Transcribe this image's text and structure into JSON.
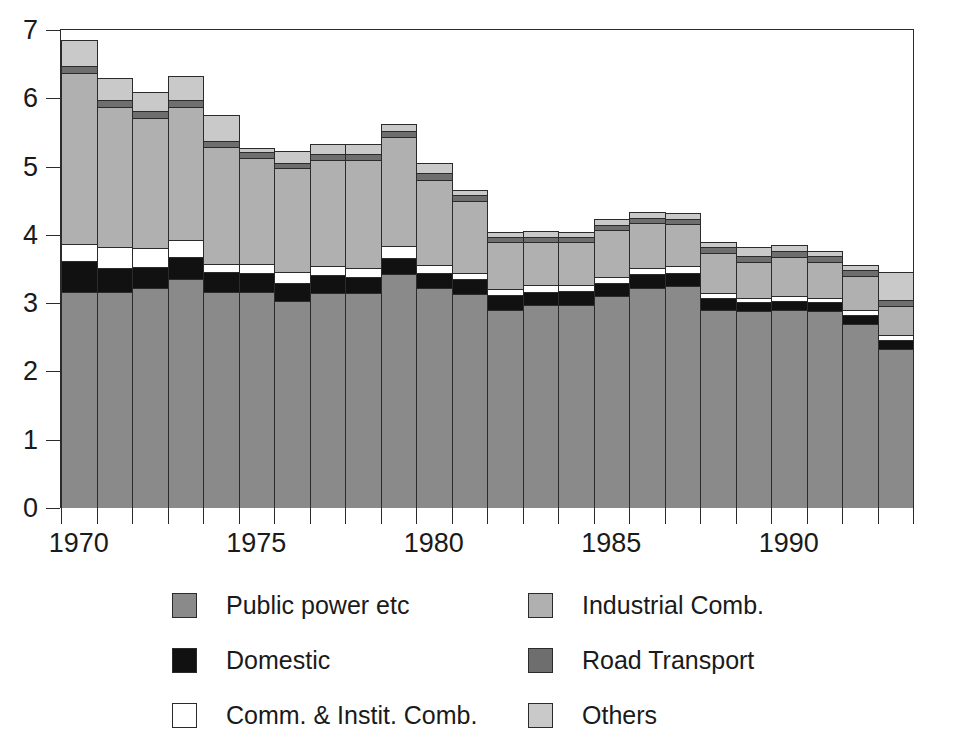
{
  "chart_data": {
    "type": "bar",
    "stacked": true,
    "title": "",
    "subtitle": "",
    "xlabel": "",
    "ylabel": "",
    "ylim": [
      0,
      7
    ],
    "ytick_labels": [
      "0",
      "1",
      "2",
      "3",
      "4",
      "5",
      "6",
      "7"
    ],
    "ytick_values": [
      0,
      1,
      2,
      3,
      4,
      5,
      6,
      7
    ],
    "grid": false,
    "legend_position": "bottom",
    "categories": [
      1970,
      1971,
      1972,
      1973,
      1974,
      1975,
      1976,
      1977,
      1978,
      1979,
      1980,
      1981,
      1982,
      1983,
      1984,
      1985,
      1986,
      1987,
      1988,
      1989,
      1990,
      1991,
      1992,
      1993
    ],
    "xtick_labels": [
      "1970",
      "1975",
      "1980",
      "1985",
      "1990"
    ],
    "xtick_values": [
      1970,
      1975,
      1980,
      1985,
      1990
    ],
    "series": [
      {
        "name": "Public power etc",
        "color": "#8a8a8a",
        "values": [
          3.17,
          3.17,
          3.22,
          3.35,
          3.17,
          3.17,
          3.03,
          3.15,
          3.15,
          3.43,
          3.22,
          3.13,
          2.9,
          2.97,
          2.97,
          3.1,
          3.22,
          3.25,
          2.9,
          2.88,
          2.9,
          2.88,
          2.7,
          2.33
        ]
      },
      {
        "name": "Domestic",
        "color": "#111111",
        "values": [
          0.45,
          0.35,
          0.31,
          0.33,
          0.28,
          0.27,
          0.27,
          0.26,
          0.24,
          0.23,
          0.22,
          0.22,
          0.22,
          0.2,
          0.21,
          0.2,
          0.2,
          0.19,
          0.17,
          0.13,
          0.13,
          0.13,
          0.13,
          0.13
        ]
      },
      {
        "name": "Comm. & Instit. Comb.",
        "color": "#ffffff",
        "values": [
          0.25,
          0.3,
          0.28,
          0.25,
          0.13,
          0.14,
          0.15,
          0.14,
          0.13,
          0.17,
          0.12,
          0.09,
          0.09,
          0.09,
          0.09,
          0.09,
          0.1,
          0.1,
          0.08,
          0.07,
          0.07,
          0.07,
          0.07,
          0.07
        ]
      },
      {
        "name": "Industrial Comb.",
        "color": "#b0b0b0",
        "values": [
          2.5,
          2.05,
          1.9,
          1.95,
          1.7,
          1.55,
          1.53,
          1.55,
          1.58,
          1.6,
          1.25,
          1.05,
          0.68,
          0.63,
          0.62,
          0.68,
          0.65,
          0.62,
          0.58,
          0.52,
          0.58,
          0.52,
          0.5,
          0.43
        ]
      },
      {
        "name": "Road Transport",
        "color": "#6e6e6e",
        "values": [
          0.1,
          0.1,
          0.1,
          0.1,
          0.1,
          0.08,
          0.08,
          0.08,
          0.08,
          0.09,
          0.09,
          0.09,
          0.08,
          0.08,
          0.08,
          0.08,
          0.08,
          0.08,
          0.09,
          0.09,
          0.09,
          0.09,
          0.09,
          0.08
        ]
      },
      {
        "name": "Others",
        "color": "#c9c9c9",
        "values": [
          0.38,
          0.33,
          0.28,
          0.35,
          0.37,
          0.07,
          0.17,
          0.15,
          0.15,
          0.1,
          0.15,
          0.08,
          0.08,
          0.08,
          0.08,
          0.08,
          0.08,
          0.08,
          0.07,
          0.14,
          0.08,
          0.08,
          0.07,
          0.42
        ]
      }
    ]
  },
  "legend": {
    "left_column": [
      {
        "label": "Public power etc",
        "color": "#8a8a8a",
        "swatch_name": "swatch-public-power"
      },
      {
        "label": "Domestic",
        "color": "#111111",
        "swatch_name": "swatch-domestic"
      },
      {
        "label": "Comm. & Instit. Comb.",
        "color": "#ffffff",
        "swatch_name": "swatch-comm-instit"
      }
    ],
    "right_column": [
      {
        "label": "Industrial Comb.",
        "color": "#b0b0b0",
        "swatch_name": "swatch-industrial"
      },
      {
        "label": "Road Transport",
        "color": "#6e6e6e",
        "swatch_name": "swatch-road-transport"
      },
      {
        "label": "Others",
        "color": "#c9c9c9",
        "swatch_name": "swatch-others"
      }
    ]
  },
  "colors": {
    "axis": "#2b2b2b",
    "background": "#ffffff",
    "public_power": "#8a8a8a",
    "domestic": "#111111",
    "comm_instit": "#ffffff",
    "industrial": "#b0b0b0",
    "road_transport": "#6e6e6e",
    "others": "#c9c9c9"
  }
}
